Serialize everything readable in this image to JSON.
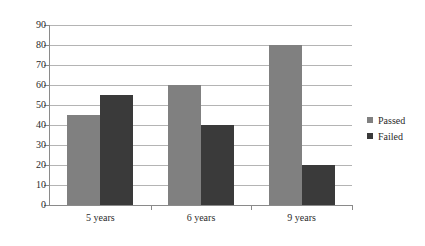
{
  "chart_data": {
    "type": "bar",
    "title": "",
    "subtitle": "",
    "xlabel": "",
    "ylabel": "",
    "categories": [
      "5 years",
      "6 years",
      "9 years"
    ],
    "series": [
      {
        "name": "Passed",
        "color": "#808080",
        "values": [
          45,
          60,
          80
        ]
      },
      {
        "name": "Failed",
        "color": "#3a3a3a",
        "values": [
          55,
          40,
          20
        ]
      }
    ],
    "ylim": [
      0,
      90
    ],
    "ytick_step": 10,
    "yticks": [
      0,
      10,
      20,
      30,
      40,
      50,
      60,
      70,
      80,
      90
    ],
    "ytick_labels": [
      "0",
      "10",
      "20",
      "30",
      "40",
      "50",
      "60",
      "70",
      "80",
      "90"
    ],
    "grid": {
      "horizontal": true,
      "vertical": false,
      "color": "#b4b4b4"
    },
    "legend": {
      "position": "right",
      "entries": [
        "Passed",
        "Failed"
      ]
    },
    "annotations": []
  }
}
